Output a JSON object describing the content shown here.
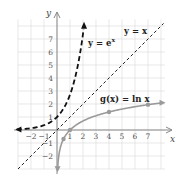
{
  "chart_data": {
    "type": "line",
    "title": "",
    "xlabel": "x",
    "ylabel": "y",
    "xlim": [
      -3,
      8
    ],
    "ylim": [
      -3,
      8.5
    ],
    "grid": true,
    "x_ticks": [
      "-2",
      "-1",
      "1",
      "2",
      "3",
      "4",
      "5",
      "6",
      "7"
    ],
    "y_ticks": [
      "7",
      "6",
      "5",
      "4",
      "3",
      "2",
      "1",
      "-1",
      "-2"
    ],
    "series": [
      {
        "name": "y = e^x",
        "label": "y = e",
        "label_exp": "x",
        "style": "bold-dashed",
        "color": "#111111",
        "x": [
          -3,
          -2,
          -1,
          0,
          1,
          1.5,
          2
        ],
        "values": [
          0.05,
          0.14,
          0.37,
          1,
          2.72,
          4.48,
          7.39
        ]
      },
      {
        "name": "y = x",
        "label": "y = x",
        "style": "thin-dashed",
        "color": "#222222",
        "x": [
          -3,
          8
        ],
        "values": [
          -3,
          8
        ]
      },
      {
        "name": "g(x) = ln x",
        "label": "g(x) = ln x",
        "style": "solid",
        "color": "#9a9a9a",
        "x": [
          0.05,
          0.5,
          1,
          2,
          4,
          7,
          8
        ],
        "values": [
          -3,
          -0.69,
          0,
          0.69,
          1.39,
          1.95,
          2.08
        ],
        "marked_points": [
          [
            0.5,
            -0.69
          ],
          [
            1,
            0
          ],
          [
            4,
            1.39
          ],
          [
            7,
            1.95
          ]
        ]
      }
    ]
  }
}
